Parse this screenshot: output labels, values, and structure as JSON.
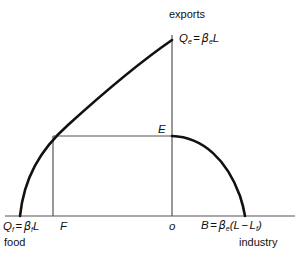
{
  "figure": {
    "axes": {
      "vertical_axis_label": "exports",
      "horizontal_axis_left_label": "food",
      "horizontal_axis_right_label": "industry",
      "origin_label": "o"
    },
    "points": {
      "peak_label_symbol": "Q",
      "peak_label_symbol_sub": "e",
      "peak_label_equals": "=",
      "peak_label_beta": "β",
      "peak_label_beta_sub": "e",
      "peak_label_var": "L",
      "equilibrium_label": "E",
      "food_intercept_symbol": "Q",
      "food_intercept_symbol_sub": "f",
      "food_intercept_equals": "=",
      "food_intercept_beta": "β",
      "food_intercept_beta_sub": "f",
      "food_intercept_var": "L",
      "foot_label": "F",
      "industry_intercept_symbol": "B",
      "industry_intercept_equals": "=",
      "industry_intercept_beta": "β",
      "industry_intercept_beta_sub": "e",
      "industry_intercept_open": "(",
      "industry_intercept_var1": "L",
      "industry_intercept_minus": "−",
      "industry_intercept_var2": "L",
      "industry_intercept_var2_sub": "f",
      "industry_intercept_close": ")"
    },
    "colors": {
      "curve": "#111111",
      "axis": "#555555",
      "construction_line": "#555555",
      "background": "#ffffff",
      "text": "#111111"
    },
    "geometry": {
      "baseline_y": 216,
      "vertical_axis_x": 172,
      "vertical_axis_top_y": 35,
      "baseline_x_start": 5,
      "baseline_x_end": 295,
      "curve_left_x": 20,
      "curve_peak_y": 40,
      "equilibrium_y": 136,
      "foot_x": 53,
      "industry_intercept_x": 245
    }
  }
}
